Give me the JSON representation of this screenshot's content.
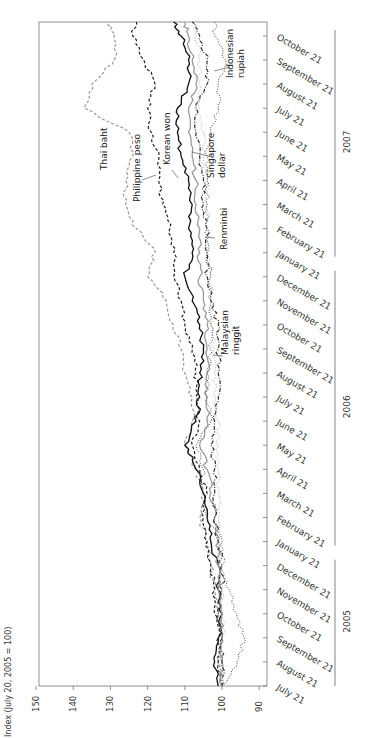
{
  "chart_data": {
    "type": "line",
    "orientation": "rotated-90-clockwise",
    "title": "",
    "ylabel": "Index (July 20, 2005 = 100)",
    "xlabel": "",
    "ylim": [
      90,
      150
    ],
    "y_ticks": [
      150,
      140,
      130,
      120,
      110,
      100,
      90
    ],
    "x_tick_labels": [
      "July 21",
      "August 21",
      "September 21",
      "October 21",
      "November 21",
      "December 21",
      "January 21",
      "February 21",
      "March 21",
      "April 21",
      "May 21",
      "June 21",
      "July 21",
      "August 21",
      "September 21",
      "October 21",
      "November 21",
      "December 21",
      "January 21",
      "February 21",
      "March 21",
      "April 21",
      "May 21",
      "June 21",
      "July 21",
      "August 21",
      "September 21",
      "October 21"
    ],
    "year_groups": [
      {
        "label": "2005",
        "from_index": 0,
        "to_index": 5
      },
      {
        "label": "2006",
        "from_index": 6,
        "to_index": 17
      },
      {
        "label": "2007",
        "from_index": 18,
        "to_index": 27
      }
    ],
    "x": [
      "2005-07-20",
      "2005-08-21",
      "2005-09-21",
      "2005-10-21",
      "2005-11-21",
      "2005-12-21",
      "2006-01-21",
      "2006-02-21",
      "2006-03-21",
      "2006-04-21",
      "2006-05-21",
      "2006-06-21",
      "2006-07-21",
      "2006-08-21",
      "2006-09-21",
      "2006-10-21",
      "2006-11-21",
      "2006-12-21",
      "2007-01-21",
      "2007-02-21",
      "2007-03-21",
      "2007-04-21",
      "2007-05-21",
      "2007-06-21",
      "2007-07-21",
      "2007-08-21",
      "2007-09-21",
      "2007-10-21",
      "2007-10-31"
    ],
    "grid": false,
    "legend": "inline labels",
    "series": [
      {
        "name": "Thai baht",
        "style": "dashed",
        "color": "#999999",
        "values": [
          100,
          101,
          100,
          101,
          102,
          103,
          104,
          106,
          105,
          107,
          110,
          108,
          108,
          110,
          111,
          113,
          115,
          120,
          118,
          123,
          126,
          126,
          124,
          125,
          137,
          135,
          129,
          129,
          131
        ]
      },
      {
        "name": "Philippine peso",
        "style": "dashed",
        "color": "#222222",
        "values": [
          100,
          101,
          101,
          102,
          102,
          103,
          104,
          105,
          104,
          106,
          108,
          106,
          107,
          107,
          108,
          110,
          111,
          113,
          113,
          114,
          116,
          117,
          117,
          119,
          120,
          118,
          121,
          124,
          123
        ]
      },
      {
        "name": "Korean won",
        "style": "solid",
        "color": "#111111",
        "values": [
          101,
          102,
          101,
          100,
          101,
          101,
          103,
          104,
          105,
          107,
          110,
          107,
          106,
          106,
          105,
          106,
          108,
          110,
          108,
          109,
          108,
          109,
          111,
          112,
          112,
          109,
          109,
          111,
          113
        ]
      },
      {
        "name": "Singapore dollar",
        "style": "solid",
        "color": "#9a9a9a",
        "values": [
          100,
          100,
          100,
          100,
          101,
          101,
          101,
          102,
          103,
          104,
          106,
          104,
          104,
          104,
          104,
          104,
          105,
          106,
          106,
          106,
          107,
          107,
          108,
          109,
          109,
          107,
          108,
          109,
          110
        ]
      },
      {
        "name": "Malaysian ringgit",
        "style": "dashdot",
        "color": "#333333",
        "values": [
          100,
          100,
          100,
          101,
          100,
          100,
          101,
          102,
          102,
          102,
          103,
          102,
          101,
          101,
          101,
          101,
          103,
          104,
          104,
          104,
          105,
          105,
          106,
          107,
          107,
          104,
          104,
          106,
          108
        ]
      },
      {
        "name": "Renminbi",
        "style": "dotted",
        "color": "#aaaaaa",
        "values": [
          100,
          100,
          100,
          100,
          100,
          101,
          101,
          101,
          101,
          101,
          101,
          101,
          102,
          102,
          102,
          103,
          103,
          103,
          104,
          104,
          104,
          104,
          105,
          105,
          106,
          106,
          106,
          107,
          107
        ]
      },
      {
        "name": "Indonesian rupiah",
        "style": "dotted",
        "color": "#444444",
        "values": [
          100,
          96,
          94,
          96,
          98,
          100,
          100,
          104,
          105,
          105,
          107,
          103,
          104,
          104,
          103,
          103,
          103,
          103,
          104,
          104,
          104,
          104,
          104,
          103,
          101,
          101,
          99,
          102,
          102
        ]
      }
    ],
    "labels": {
      "thai_baht": [
        "Thai baht"
      ],
      "philippine_peso": [
        "Philippine peso"
      ],
      "korean_won": [
        "Korean won"
      ],
      "singapore_dollar": [
        "Singapore",
        "dollar"
      ],
      "renminbi": [
        "Renminbi"
      ],
      "malaysian_ringgit": [
        "Malaysian",
        "ringgit"
      ],
      "indonesian_rupiah": [
        "Indonesian",
        "rupiah"
      ]
    }
  }
}
